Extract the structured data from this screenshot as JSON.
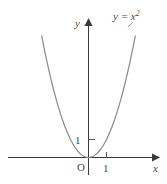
{
  "figure": {
    "kind": "math-graph",
    "background_color": "#ffffff",
    "curve_color": "#8d8d8d",
    "axis_color": "#3a3a3a",
    "text_color": "#4a4a4a",
    "equation_label": {
      "base": "y = x",
      "exponent": "2",
      "full": "y = x²"
    },
    "axes": {
      "x_axis_name": "x",
      "y_axis_name": "y",
      "origin_label": "O",
      "x_tick_label": "1",
      "y_tick_label": "1"
    }
  },
  "chart_data": {
    "type": "line",
    "title": "",
    "subtitle": "",
    "xlabel": "x",
    "ylabel": "y",
    "annotations": [
      {
        "text": "y = x²",
        "x": 2.3,
        "y": 7.6
      },
      {
        "text": "O",
        "x": -0.3,
        "y": -0.55
      }
    ],
    "grid": false,
    "legend": null,
    "xlim": [
      -4.85,
      4.3
    ],
    "ylim": [
      -1.5,
      7.6
    ],
    "xticks": [
      1
    ],
    "xtick_labels": [
      "1"
    ],
    "yticks": [
      1
    ],
    "ytick_labels": [
      "1"
    ],
    "series": [
      {
        "name": "y = x²",
        "formula": "y = x^2",
        "color": "#8d8d8d",
        "x": [
          -2.6,
          -2.4,
          -2.2,
          -2.0,
          -1.8,
          -1.6,
          -1.4,
          -1.2,
          -1.0,
          -0.8,
          -0.6,
          -0.4,
          -0.2,
          0.0,
          0.2,
          0.4,
          0.6,
          0.8,
          1.0,
          1.2,
          1.4,
          1.6,
          1.8,
          2.0,
          2.2,
          2.4,
          2.6
        ],
        "values": [
          6.76,
          5.76,
          4.84,
          4.0,
          3.24,
          2.56,
          1.96,
          1.44,
          1.0,
          0.64,
          0.36,
          0.16,
          0.04,
          0.0,
          0.04,
          0.16,
          0.36,
          0.64,
          1.0,
          1.44,
          1.96,
          2.56,
          3.24,
          4.0,
          4.84,
          5.76,
          6.76
        ]
      }
    ]
  }
}
